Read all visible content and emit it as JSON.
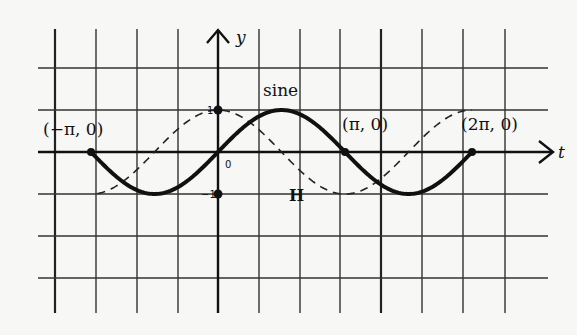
{
  "chart_data": {
    "type": "line",
    "title": "",
    "xlabel": "t",
    "ylabel": "y",
    "xlim_units_of_pi": [
      -1.25,
      2.5
    ],
    "ylim": [
      -3,
      2
    ],
    "grid": true,
    "grid_x_step_units_of_pi": 0.3333,
    "grid_y_step": 1,
    "series": [
      {
        "name": "sine",
        "function": "sin(t)",
        "style": "solid-thick",
        "t_range_units_of_pi": [
          -1,
          2
        ],
        "label": "sine"
      },
      {
        "name": "H",
        "function": "cos(t)",
        "style": "dashed",
        "t_range_units_of_pi": [
          -0.95,
          2.0
        ],
        "label": "H"
      }
    ],
    "annotations": [
      {
        "text": "(−π, 0)",
        "t_units_of_pi": -1,
        "y": 0
      },
      {
        "text": "(π, 0)",
        "t_units_of_pi": 1,
        "y": 0
      },
      {
        "text": "(2π, 0)",
        "t_units_of_pi": 2,
        "y": 0
      }
    ],
    "y_tick_labels": [
      {
        "text": "1",
        "value": 1
      },
      {
        "text": "−1",
        "value": -1
      }
    ],
    "origin_label": "0"
  }
}
